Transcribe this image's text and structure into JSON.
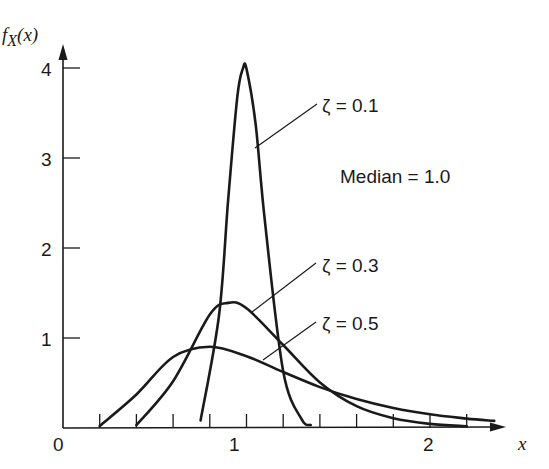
{
  "chart_data": {
    "type": "line",
    "title": "",
    "xlabel": "x",
    "ylabel": "f_X(x)",
    "xlim": [
      0,
      2.5
    ],
    "ylim": [
      0,
      4.3
    ],
    "grid": false,
    "x_ticks": [
      0,
      0.2,
      0.4,
      0.6,
      0.8,
      1.0,
      1.2,
      1.4,
      1.6,
      1.8,
      2.0,
      2.2
    ],
    "x_tick_labels": [
      {
        "value": 0,
        "label": "0"
      },
      {
        "value": 1,
        "label": "1"
      },
      {
        "value": 2,
        "label": "2"
      }
    ],
    "y_ticks": [
      {
        "value": 1,
        "label": "1"
      },
      {
        "value": 2,
        "label": "2"
      },
      {
        "value": 3,
        "label": "3"
      },
      {
        "value": 4,
        "label": "4"
      }
    ],
    "annotation": "Median = 1.0",
    "series": [
      {
        "name": "ζ = 0.1",
        "x": [
          0.75,
          0.85,
          0.9,
          0.95,
          0.98,
          1.0,
          1.05,
          1.1,
          1.2,
          1.3,
          1.35
        ],
        "y": [
          0.085,
          1.25,
          2.54,
          3.68,
          3.99,
          3.99,
          3.37,
          2.3,
          0.63,
          0.098,
          0.033
        ]
      },
      {
        "name": "ζ = 0.3",
        "x": [
          0.4,
          0.6,
          0.8,
          0.9,
          1.0,
          1.2,
          1.4,
          1.6,
          1.8,
          2.0,
          2.2
        ],
        "y": [
          0.031,
          0.52,
          1.26,
          1.39,
          1.33,
          0.922,
          0.507,
          0.243,
          0.109,
          0.046,
          0.019
        ]
      },
      {
        "name": "ζ = 0.5",
        "x": [
          0.2,
          0.4,
          0.6,
          0.8,
          1.0,
          1.2,
          1.4,
          1.6,
          1.8,
          2.0,
          2.2,
          2.35
        ],
        "y": [
          0.022,
          0.372,
          0.789,
          0.903,
          0.798,
          0.622,
          0.455,
          0.321,
          0.222,
          0.153,
          0.105,
          0.079
        ]
      }
    ]
  },
  "labels": {
    "y_axis": "f",
    "y_axis_sub": "X",
    "y_axis_arg": "(x)",
    "x_axis": "x",
    "zeta01": "ζ = 0.1",
    "zeta03": "ζ = 0.3",
    "zeta05": "ζ = 0.5",
    "median": "Median = 1.0",
    "origin": "0",
    "x1": "1",
    "x2": "2",
    "y1": "1",
    "y2": "2",
    "y3": "3",
    "y4": "4"
  }
}
